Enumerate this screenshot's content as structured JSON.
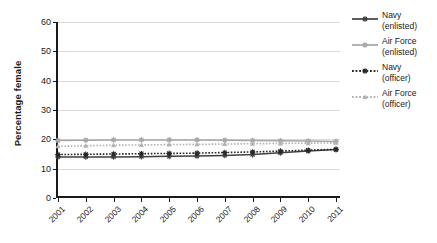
{
  "chart_data": {
    "type": "line",
    "title": "",
    "xlabel": "",
    "ylabel": "Percentage female",
    "ylim": [
      0,
      60
    ],
    "ytick_values": [
      0,
      10,
      20,
      30,
      40,
      50,
      60
    ],
    "ytick_labels": [
      "0",
      "10",
      "20",
      "30",
      "40",
      "50",
      "60"
    ],
    "grid": true,
    "legend_position": "right",
    "categories": [
      "2001",
      "2002",
      "2003",
      "2004",
      "2005",
      "2006",
      "2007",
      "2008",
      "2009",
      "2010",
      "2011"
    ],
    "x": [
      2001,
      2002,
      2003,
      2004,
      2005,
      2006,
      2007,
      2008,
      2009,
      2010,
      2011
    ],
    "series": [
      {
        "name": "Navy (enlisted)",
        "label": "Navy\n(enlisted)",
        "color": "#404040",
        "line_style": "solid",
        "marker": "asterisk",
        "values": [
          14.0,
          14.0,
          14.0,
          14.1,
          14.2,
          14.3,
          14.5,
          14.8,
          15.4,
          16.0,
          16.5
        ]
      },
      {
        "name": "Air Force (enlisted)",
        "label": "Air Force\n(enlisted)",
        "color": "#a6a6a6",
        "line_style": "solid",
        "marker": "asterisk",
        "values": [
          19.6,
          19.7,
          19.8,
          19.8,
          19.8,
          19.8,
          19.7,
          19.6,
          19.5,
          19.4,
          19.3
        ]
      },
      {
        "name": "Navy (officer)",
        "label": "Navy\n(officer)",
        "color": "#262626",
        "line_style": "dotted",
        "marker": "asterisk",
        "values": [
          14.8,
          14.9,
          15.0,
          15.1,
          15.2,
          15.3,
          15.5,
          15.7,
          16.0,
          16.3,
          16.6
        ]
      },
      {
        "name": "Air Force (officer)",
        "label": "Air Force\n(officer)",
        "color": "#b3b3b3",
        "line_style": "dotted",
        "marker": "triangle",
        "values": [
          17.6,
          17.8,
          18.0,
          18.1,
          18.2,
          18.3,
          18.4,
          18.5,
          18.6,
          18.7,
          18.8
        ]
      }
    ]
  },
  "legend": {
    "items": [
      {
        "label": "Navy\n(enlisted)"
      },
      {
        "label": "Air Force\n(enlisted)"
      },
      {
        "label": "Navy\n(officer)"
      },
      {
        "label": "Air Force\n(officer)"
      }
    ]
  },
  "axis": {
    "y_title": "Percentage female"
  }
}
